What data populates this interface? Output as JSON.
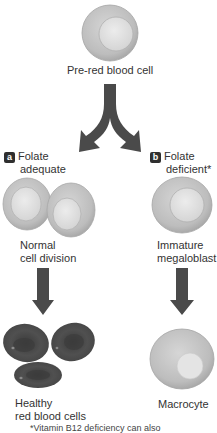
{
  "top": {
    "cell_label": "Pre-red blood cell"
  },
  "branches": [
    {
      "badge": "a",
      "condition_line1": "Folate",
      "condition_line2": "adequate",
      "middle_line1": "Normal",
      "middle_line2": "cell division",
      "result_line1": "Healthy",
      "result_line2": "red blood cells"
    },
    {
      "badge": "b",
      "condition_line1": "Folate",
      "condition_line2": "deficient*",
      "middle_line1": "Immature",
      "middle_line2": "megaloblast",
      "result_line1": "Macrocyte",
      "result_line2": ""
    }
  ],
  "footnote": "*Vitamin B12 deficiency can also",
  "colors": {
    "arrow": "#4a4a4a",
    "cell_light": "#c8c8c8",
    "cell_nucleus": "#e2e2e2",
    "healthy_rbc": "#4c4c4c",
    "badge": "#2f2f2f"
  }
}
